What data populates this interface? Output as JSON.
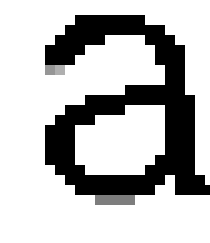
{
  "glyph": {
    "character": "a",
    "background": "#ffffff",
    "foreground": "#000000",
    "cell_size": 10,
    "origin": [
      15,
      15
    ],
    "rows": [
      "......0000000.....",
      ".....0000000000...",
      "....00000....000..",
      "...0000.......000.",
      "...000........000.",
      "...67..........00.",
      "...............00.",
      "...........000000.",
      ".......00000000000",
      ".....000000....000",
      "....0000.......000",
      "...000.........000",
      "...000.........000",
      "...000.........000",
      "...000........0000",
      "....000......00000",
      ".....0000000000.000",
      "......00000000..0000",
      "........5555...."
    ]
  }
}
